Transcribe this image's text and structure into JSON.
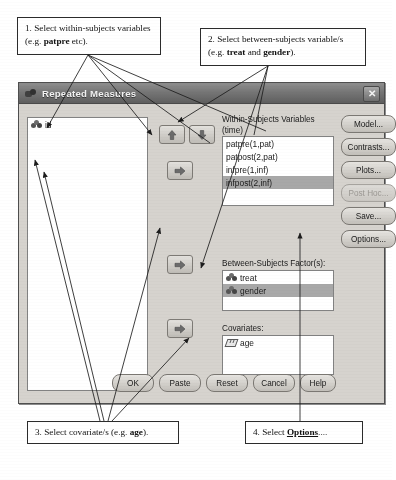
{
  "annotations": [
    {
      "id": "callout-1",
      "text": "1. Select within-subjects variables (e.g. patpre etc).",
      "lead": "1. Select within-subjects variables (e.g. ",
      "bold": "patpre",
      "tail": " etc)."
    },
    {
      "id": "callout-2",
      "text": "2. Select between-subjects variable/s (e.g. treat and gender).",
      "lead": "2. Select between-subjects variable/s (e.g. ",
      "bold": "treat",
      "mid": " and ",
      "bold2": "gender",
      "tail": ")."
    },
    {
      "id": "callout-3",
      "text": "3. Select covariate/s (e.g. age).",
      "lead": "3. Select covariate/s (e.g. ",
      "bold": "age",
      "tail": ")."
    },
    {
      "id": "callout-4",
      "text": "4. Select Options....",
      "lead": "4. Select ",
      "bold": "Options",
      "tail": "...."
    }
  ],
  "dialog": {
    "title": "Repeated Measures",
    "titlebar_icon": "variables-icon",
    "close_label": "✕",
    "source_list": {
      "items": [
        {
          "label": "id",
          "icon": "nominal-icon",
          "selected": false
        }
      ]
    },
    "transfer_buttons": [
      {
        "name": "move-up-button",
        "icon": "arrow-up-icon"
      },
      {
        "name": "move-down-button",
        "icon": "arrow-down-icon"
      },
      {
        "name": "move-to-within-subjects-button",
        "icon": "arrow-right-icon"
      },
      {
        "name": "move-to-between-subjects-button",
        "icon": "arrow-right-icon"
      },
      {
        "name": "move-to-covariates-button",
        "icon": "arrow-right-icon"
      }
    ],
    "within_subjects": {
      "label": "Within-Subjects Variables",
      "factor": "(time)",
      "items": [
        {
          "label": "patpre(1,pat)",
          "selected": false
        },
        {
          "label": "patpost(2,pat)",
          "selected": false
        },
        {
          "label": "infpre(1,inf)",
          "selected": false
        },
        {
          "label": "infpost(2,inf)",
          "selected": true
        }
      ]
    },
    "between_subjects": {
      "label": "Between-Subjects Factor(s):",
      "items": [
        {
          "label": "treat",
          "icon": "nominal-icon",
          "selected": false
        },
        {
          "label": "gender",
          "icon": "nominal-icon",
          "selected": true
        }
      ]
    },
    "covariates": {
      "label": "Covariates:",
      "items": [
        {
          "label": "age",
          "icon": "scale-icon",
          "selected": false
        }
      ]
    },
    "side_buttons": [
      {
        "label": "Model...",
        "enabled": true
      },
      {
        "label": "Contrasts...",
        "enabled": true
      },
      {
        "label": "Plots...",
        "enabled": true
      },
      {
        "label": "Post Hoc...",
        "enabled": false
      },
      {
        "label": "Save...",
        "enabled": true
      },
      {
        "label": "Options...",
        "enabled": true
      }
    ],
    "bottom_buttons": [
      {
        "label": "OK"
      },
      {
        "label": "Paste"
      },
      {
        "label": "Reset"
      },
      {
        "label": "Cancel"
      },
      {
        "label": "Help"
      }
    ]
  },
  "colors": {
    "dialog_face": "#d6d3ce",
    "titlebar": "#767676",
    "selection": "#a8a8a8",
    "list_bg": "#ffffff",
    "border": "#828282"
  }
}
